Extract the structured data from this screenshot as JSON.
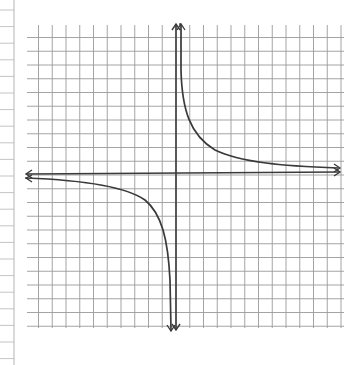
{
  "chart_data": {
    "type": "line",
    "title": "",
    "subtitle": "",
    "xlabel": "",
    "ylabel": "",
    "grid": true,
    "legend": null,
    "xlim": [
      -11,
      12
    ],
    "ylim": [
      -11,
      11
    ],
    "series": [
      {
        "name": "right branch (x > 0)",
        "x": [
          0.25,
          0.5,
          1,
          2,
          3,
          4,
          6,
          8,
          10,
          11.8
        ],
        "y": [
          11,
          8,
          4.5,
          2.3,
          1.5,
          1.1,
          0.75,
          0.55,
          0.45,
          0.4
        ]
      },
      {
        "name": "left branch (x < 0)",
        "x": [
          -10.8,
          -8,
          -6,
          -4,
          -3,
          -2,
          -1,
          -0.5,
          -0.25
        ],
        "y": [
          -0.35,
          -0.5,
          -0.7,
          -1.1,
          -1.5,
          -2.3,
          -4.5,
          -8,
          -11
        ]
      }
    ],
    "axes": {
      "x_axis_arrows": true,
      "y_axis_arrows": true
    }
  },
  "colors": {
    "ink": "#3a3a3a",
    "grid": "#9a9a9a",
    "margin_lines": "#b5b5b5",
    "paper": "#ffffff"
  }
}
